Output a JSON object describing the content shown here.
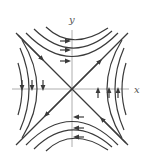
{
  "diagram": {
    "type": "phase-portrait",
    "equilibrium": "saddle",
    "axes": {
      "x_label": "x",
      "y_label": "y"
    },
    "colors": {
      "trajectory": "#3a3a3a",
      "axis": "#9a9a9a",
      "label": "#555555"
    },
    "trajectory_directions": {
      "top": "right",
      "bottom": "left",
      "right": "up",
      "left": "down",
      "diagonal_y_eq_x": "away-from-origin (inferred)",
      "diagonal_y_eq_neg_x": "toward-origin (inferred)"
    }
  }
}
